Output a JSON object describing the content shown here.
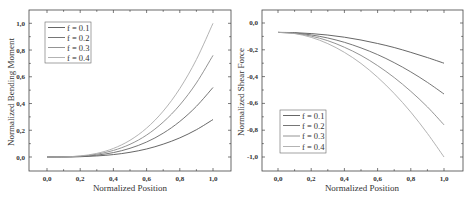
{
  "chart_data": [
    {
      "type": "line",
      "title": "",
      "xlabel": "Normalized Position",
      "ylabel": "Normalized Bending Moment",
      "xlim": [
        -0.1,
        1.1
      ],
      "ylim": [
        -0.1,
        1.1
      ],
      "xticks": [
        "0,0",
        "0,2",
        "0,4",
        "0,6",
        "0,8",
        "1,0"
      ],
      "yticks": [
        "0,0",
        "0,2",
        "0,4",
        "0,6",
        "0,8",
        "1,0"
      ],
      "grid": false,
      "legend_position": "upper-left",
      "x": [
        0.0,
        0.1,
        0.2,
        0.3,
        0.4,
        0.5,
        0.6,
        0.7,
        0.8,
        0.9,
        1.0
      ],
      "series": [
        {
          "name": "f = 0.1",
          "color": "#555555",
          "values": [
            0.0,
            0.0003,
            0.002,
            0.008,
            0.018,
            0.035,
            0.06,
            0.096,
            0.143,
            0.204,
            0.28
          ]
        },
        {
          "name": "f = 0.2",
          "color": "#666666",
          "values": [
            0.0,
            0.0005,
            0.004,
            0.014,
            0.033,
            0.065,
            0.112,
            0.178,
            0.266,
            0.379,
            0.52
          ]
        },
        {
          "name": "f = 0.3",
          "color": "#888888",
          "values": [
            0.0,
            0.0008,
            0.006,
            0.021,
            0.049,
            0.095,
            0.164,
            0.261,
            0.389,
            0.554,
            0.76
          ]
        },
        {
          "name": "f = 0.4",
          "color": "#aaaaaa",
          "values": [
            0.0,
            0.001,
            0.008,
            0.027,
            0.064,
            0.125,
            0.216,
            0.343,
            0.512,
            0.729,
            1.0
          ]
        }
      ]
    },
    {
      "type": "line",
      "title": "",
      "xlabel": "Normalized Position",
      "ylabel": "Normalized Shear Force",
      "xlim": [
        -0.1,
        1.1
      ],
      "ylim": [
        -1.1,
        0.1
      ],
      "xticks": [
        "0,0",
        "0,2",
        "0,4",
        "0,6",
        "0,8",
        "1,0"
      ],
      "yticks": [
        "0,0",
        "-0,2",
        "-0,4",
        "-0,6",
        "-0,8",
        "-1,0"
      ],
      "grid": false,
      "legend_position": "lower-left",
      "x": [
        0.0,
        0.1,
        0.2,
        0.3,
        0.4,
        0.5,
        0.6,
        0.7,
        0.8,
        0.9,
        1.0
      ],
      "series": [
        {
          "name": "f = 0.1",
          "color": "#555555",
          "values": [
            -0.07,
            -0.072,
            -0.079,
            -0.09,
            -0.106,
            -0.127,
            -0.153,
            -0.183,
            -0.219,
            -0.258,
            -0.3
          ]
        },
        {
          "name": "f = 0.2",
          "color": "#666666",
          "values": [
            -0.07,
            -0.075,
            -0.089,
            -0.112,
            -0.144,
            -0.186,
            -0.236,
            -0.296,
            -0.365,
            -0.443,
            -0.53
          ]
        },
        {
          "name": "f = 0.3",
          "color": "#888888",
          "values": [
            -0.07,
            -0.077,
            -0.098,
            -0.132,
            -0.181,
            -0.242,
            -0.318,
            -0.407,
            -0.51,
            -0.626,
            -0.76
          ]
        },
        {
          "name": "f = 0.4",
          "color": "#aaaaaa",
          "values": [
            -0.07,
            -0.079,
            -0.107,
            -0.154,
            -0.219,
            -0.302,
            -0.405,
            -0.526,
            -0.665,
            -0.824,
            -1.0
          ]
        }
      ]
    }
  ],
  "left_chart": {
    "xlabel": "Normalized Position",
    "ylabel": "Normalized Bending Moment",
    "xticks": [
      "0,0",
      "0,2",
      "0,4",
      "0,6",
      "0,8",
      "1,0"
    ],
    "yticks": [
      "0,0",
      "0,2",
      "0,4",
      "0,6",
      "0,8",
      "1,0"
    ],
    "legend": [
      "f = 0.1",
      "f = 0.2",
      "f = 0.3",
      "f = 0.4"
    ]
  },
  "right_chart": {
    "xlabel": "Normalized Position",
    "ylabel": "Normalized Shear Force",
    "xticks": [
      "0,0",
      "0,2",
      "0,4",
      "0,6",
      "0,8",
      "1,0"
    ],
    "yticks": [
      "0,0",
      "-0,2",
      "-0,4",
      "-0,6",
      "-0,8",
      "-1,0"
    ],
    "legend": [
      "f = 0.1",
      "f = 0.2",
      "f = 0.3",
      "f = 0.4"
    ]
  }
}
